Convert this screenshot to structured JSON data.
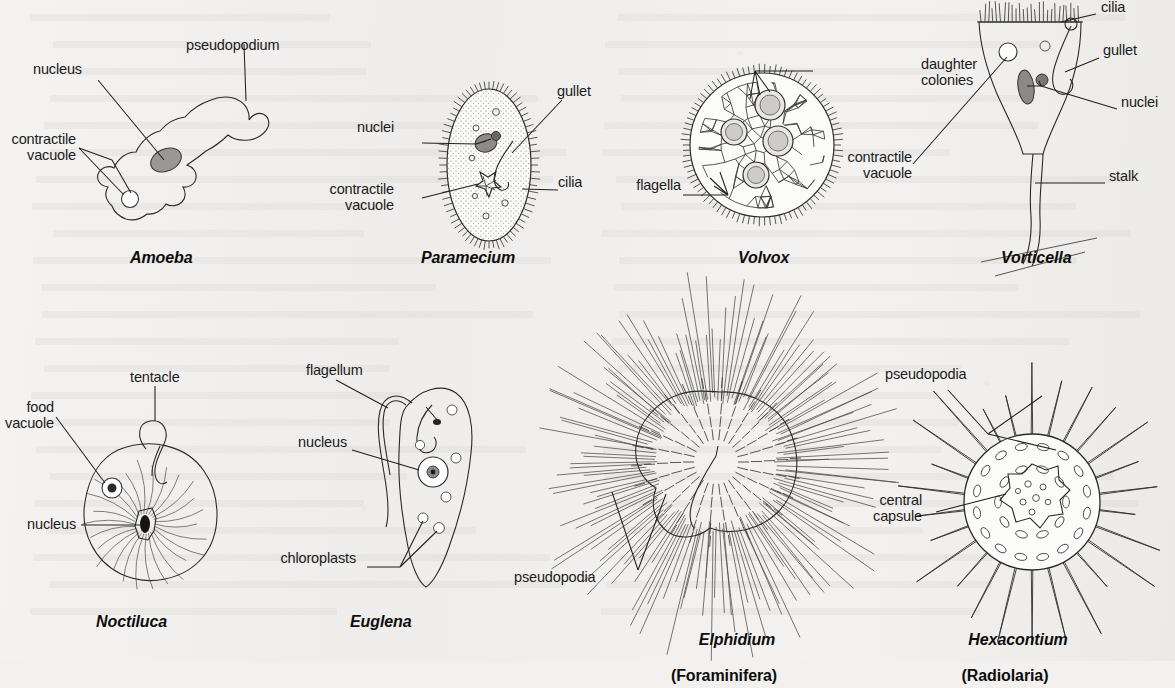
{
  "figure": {
    "background_color": "#f2f1ef",
    "ink_color": "#2a2a2a",
    "label_color": "#1b1b1b",
    "kind": "labelled biological line-drawing plate of protozoan / protist types",
    "rows": 2,
    "columns": 4
  },
  "panels": [
    {
      "id": "amoeba",
      "caption": "Amoeba",
      "group": "",
      "labels": [
        {
          "key": "nucleus",
          "text": "nucleus"
        },
        {
          "key": "pseudopodium",
          "text": "pseudopodium"
        },
        {
          "key": "contractile_vacuole",
          "text": "contractile\nvacuole"
        }
      ]
    },
    {
      "id": "paramecium",
      "caption": "Paramecium",
      "group": "",
      "labels": [
        {
          "key": "nuclei",
          "text": "nuclei"
        },
        {
          "key": "gullet",
          "text": "gullet"
        },
        {
          "key": "contractile_vacuole",
          "text": "contractile\nvacuole"
        },
        {
          "key": "cilia",
          "text": "cilia"
        }
      ]
    },
    {
      "id": "volvox",
      "caption": "Volvox",
      "group": "",
      "labels": [
        {
          "key": "daughter_colonies",
          "text": "daughter\ncolonies"
        },
        {
          "key": "flagella",
          "text": "flagella"
        }
      ]
    },
    {
      "id": "vorticella",
      "caption": "Vorticella",
      "group": "",
      "labels": [
        {
          "key": "cilia",
          "text": "cilia"
        },
        {
          "key": "gullet",
          "text": "gullet"
        },
        {
          "key": "nuclei",
          "text": "nuclei"
        },
        {
          "key": "contractile_vacuole",
          "text": "contractile\nvacuole"
        },
        {
          "key": "stalk",
          "text": "stalk"
        }
      ]
    },
    {
      "id": "noctiluca",
      "caption": "Noctiluca",
      "group": "",
      "labels": [
        {
          "key": "tentacle",
          "text": "tentacle"
        },
        {
          "key": "food_vacuole",
          "text": "food\nvacuole"
        },
        {
          "key": "nucleus",
          "text": "nucleus"
        }
      ]
    },
    {
      "id": "euglena",
      "caption": "Euglena",
      "group": "",
      "labels": [
        {
          "key": "flagellum",
          "text": "flagellum"
        },
        {
          "key": "nucleus",
          "text": "nucleus"
        },
        {
          "key": "chloroplasts",
          "text": "chloroplasts"
        }
      ]
    },
    {
      "id": "elphidium",
      "caption": "Elphidium",
      "group": "(Foraminifera)",
      "labels": [
        {
          "key": "pseudopodia",
          "text": "pseudopodia"
        }
      ]
    },
    {
      "id": "hexacontium",
      "caption": "Hexacontium",
      "group": "(Radiolaria)",
      "labels": [
        {
          "key": "pseudopodia",
          "text": "pseudopodia"
        },
        {
          "key": "central_capsule",
          "text": "central\ncapsule"
        }
      ]
    }
  ]
}
